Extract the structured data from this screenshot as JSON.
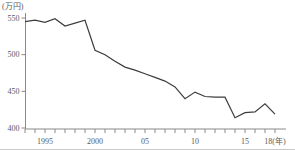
{
  "chart_data": {
    "type": "line",
    "title": "",
    "unit_label": "(万円)",
    "xlabel_suffix": "(年)",
    "x": [
      1993,
      1994,
      1995,
      1996,
      1997,
      1998,
      1999,
      2000,
      2001,
      2002,
      2003,
      2004,
      2005,
      2006,
      2007,
      2008,
      2009,
      2010,
      2011,
      2012,
      2013,
      2014,
      2015,
      2016,
      2017,
      2018
    ],
    "values": [
      545,
      547,
      544,
      549,
      539,
      543,
      547,
      506,
      500,
      491,
      483,
      479,
      474,
      469,
      464,
      456,
      440,
      449,
      443,
      442,
      442,
      414,
      421,
      422,
      433,
      419
    ],
    "ylim": [
      400,
      560
    ],
    "grid": false,
    "legend": "none",
    "y_ticks": [
      {
        "value": 550,
        "label": "550"
      },
      {
        "value": 500,
        "label": "500"
      },
      {
        "value": 450,
        "label": "450"
      },
      {
        "value": 400,
        "label": "400"
      }
    ],
    "x_ticks_major": [
      {
        "year": 1995,
        "label": "1995"
      },
      {
        "year": 2000,
        "label": "2000"
      },
      {
        "year": 2005,
        "label": "05"
      },
      {
        "year": 2010,
        "label": "10"
      },
      {
        "year": 2015,
        "label": "15"
      },
      {
        "year": 2018,
        "label": "18(年)"
      }
    ],
    "x_minor_tick_years": {
      "from": 1993,
      "to": 2018,
      "step": 1
    },
    "colors": {
      "line": "#3d3d3d",
      "axis": "#8a8a8a",
      "tick": "#8a8a8a",
      "label": "#5a5a5a"
    },
    "layout": {
      "width": 295,
      "height": 150,
      "y_axis_x": 25.5,
      "y_axis_top": 13,
      "x_axis_y": 129,
      "x_axis_end": 286,
      "x_start": 25,
      "px_per_year": 10,
      "year0": 1993,
      "y_px_at_550": 18,
      "y_px_at_400": 128,
      "tick_len": 4,
      "font_size": 8
    }
  }
}
